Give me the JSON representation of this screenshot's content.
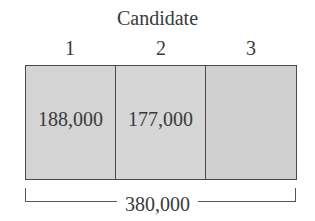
{
  "diagram": {
    "title": "Candidate",
    "candidates": [
      {
        "label": "1",
        "votes": "188,000"
      },
      {
        "label": "2",
        "votes": "177,000"
      },
      {
        "label": "3",
        "votes": ""
      }
    ],
    "total": "380,000"
  },
  "colors": {
    "fill": "#d4d4d4",
    "border": "#4a4a4a",
    "text": "#3a3a3a"
  }
}
